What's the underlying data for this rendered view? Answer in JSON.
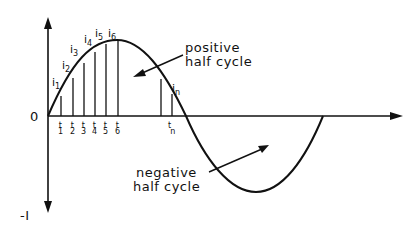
{
  "diagram": {
    "axis_labels": {
      "origin": "0",
      "negative_peak": "-I"
    },
    "annotations": {
      "positive_line1": "positive",
      "positive_line2": "half cycle",
      "negative_line1": "negative",
      "negative_line2": "half cycle"
    },
    "current_labels": [
      {
        "base": "i",
        "sub": "1"
      },
      {
        "base": "i",
        "sub": "2"
      },
      {
        "base": "i",
        "sub": "3"
      },
      {
        "base": "i",
        "sub": "4"
      },
      {
        "base": "i",
        "sub": "5"
      },
      {
        "base": "i",
        "sub": "6"
      },
      {
        "base": "i",
        "sub": "n"
      }
    ],
    "time_labels": [
      {
        "base": "t",
        "sub": "1"
      },
      {
        "base": "t",
        "sub": "2"
      },
      {
        "base": "t",
        "sub": "3"
      },
      {
        "base": "t",
        "sub": "4"
      },
      {
        "base": "t",
        "sub": "5"
      },
      {
        "base": "t",
        "sub": "6"
      },
      {
        "base": "t",
        "sub": "n"
      }
    ],
    "colors": {
      "stroke": "#111111",
      "background": "#ffffff"
    }
  }
}
